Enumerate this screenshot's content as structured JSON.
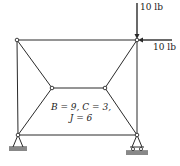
{
  "diagram": {
    "type": "truss",
    "colors": {
      "line": "#2a2a2a",
      "joint_fill": "#ffffff",
      "ground": "#888888"
    },
    "joints": [
      {
        "id": "top-left",
        "x": 17,
        "y": 40
      },
      {
        "id": "top-right",
        "x": 137,
        "y": 40
      },
      {
        "id": "inner-left",
        "x": 52,
        "y": 88
      },
      {
        "id": "inner-right",
        "x": 105,
        "y": 88
      },
      {
        "id": "bottom-left",
        "x": 18,
        "y": 135
      },
      {
        "id": "bottom-right",
        "x": 137,
        "y": 135
      }
    ],
    "members": [
      [
        "top-left",
        "top-right"
      ],
      [
        "top-left",
        "bottom-left"
      ],
      [
        "top-right",
        "bottom-right"
      ],
      [
        "bottom-left",
        "bottom-right"
      ],
      [
        "top-left",
        "inner-left"
      ],
      [
        "inner-left",
        "inner-right"
      ],
      [
        "inner-right",
        "top-right"
      ],
      [
        "inner-left",
        "bottom-left"
      ],
      [
        "inner-right",
        "bottom-right"
      ]
    ],
    "supports": [
      {
        "joint": "bottom-left",
        "type": "pin"
      },
      {
        "joint": "bottom-right",
        "type": "roller"
      }
    ],
    "loads": [
      {
        "joint": "top-right",
        "direction": "down",
        "label": "10 lb"
      },
      {
        "joint": "top-right",
        "direction": "left",
        "label": "10 lb"
      }
    ],
    "annotation": {
      "line1": "B = 9, C = 3,",
      "line2": "J = 6"
    }
  }
}
